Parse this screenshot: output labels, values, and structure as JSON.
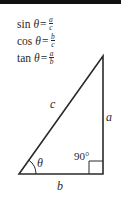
{
  "formulas": [
    {
      "fn": "sin",
      "var": "θ",
      "eq": "=",
      "num": "a",
      "den": "c"
    },
    {
      "fn": "cos",
      "var": "θ",
      "eq": "=",
      "num": "b",
      "den": "c"
    },
    {
      "fn": "tan",
      "var": "θ",
      "eq": "=",
      "num": "a",
      "den": "b"
    }
  ],
  "triangle": {
    "hypotenuse_label": "c",
    "opposite_label": "a",
    "adjacent_label": "b",
    "angle_label": "θ",
    "right_angle_label": "90°"
  },
  "colors": {
    "stroke": "#2a2a2a",
    "background": "#ffffff",
    "top_bar": "#111111"
  }
}
